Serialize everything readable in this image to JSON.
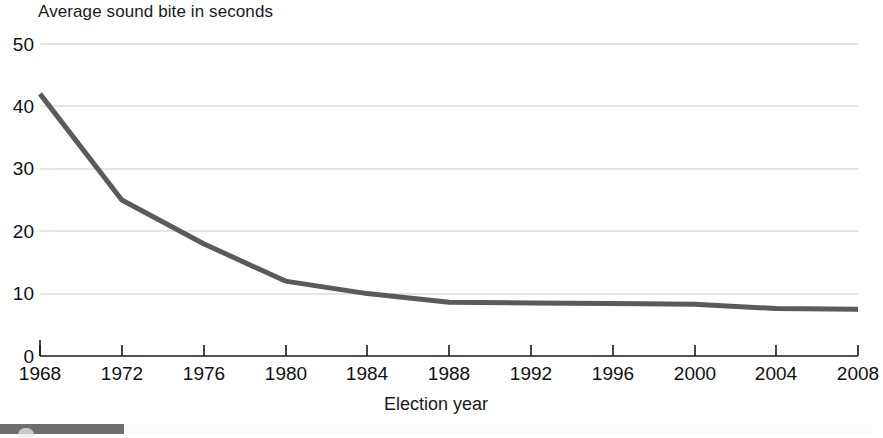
{
  "chart_data": {
    "type": "line",
    "title": "Average sound bite in seconds",
    "xlabel": "Election year",
    "ylabel": "",
    "categories": [
      1968,
      1972,
      1976,
      1980,
      1984,
      1988,
      1992,
      1996,
      2000,
      2004,
      2008
    ],
    "x_tick_labels": [
      "1968",
      "1972",
      "1976",
      "1980",
      "1984",
      "1988",
      "1992",
      "1996",
      "2000",
      "2004",
      "2008"
    ],
    "values": [
      42,
      25,
      18,
      12,
      10,
      8.6,
      8.5,
      8.4,
      8.3,
      7.6,
      7.5
    ],
    "y_tick_labels": [
      "0",
      "10",
      "20",
      "30",
      "40",
      "50"
    ],
    "y_ticks": [
      0,
      10,
      20,
      30,
      40,
      50
    ],
    "ylim": [
      0,
      50
    ],
    "xlim": [
      1968,
      2008
    ],
    "grid": true,
    "grid_axis": "y",
    "legend": false,
    "legend_position": "none",
    "series": [
      {
        "name": "Average sound bite in seconds",
        "color": "#5a5a5a",
        "values": [
          42,
          25,
          18,
          12,
          10,
          8.6,
          8.5,
          8.4,
          8.3,
          7.6,
          7.5
        ]
      }
    ]
  },
  "colors": {
    "line": "#5a5a5a",
    "grid": "#c9c9c9",
    "axis": "#1a1a1a",
    "background": "#ffffff",
    "bottom_bar": "#6e6e6e"
  },
  "axes": {
    "x_title": "Election year",
    "y_title": ""
  }
}
